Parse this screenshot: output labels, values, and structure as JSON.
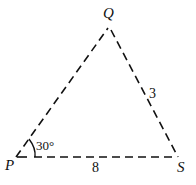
{
  "diagram": {
    "type": "triangle",
    "vertices": {
      "P": {
        "label": "P"
      },
      "Q": {
        "label": "Q"
      },
      "S": {
        "label": "S"
      }
    },
    "sides": {
      "QS": {
        "label": "3"
      },
      "PS": {
        "label": "8"
      }
    },
    "angles": {
      "P": {
        "label": "30°"
      }
    },
    "line_style": "dashed",
    "stroke_color": "#111111"
  }
}
